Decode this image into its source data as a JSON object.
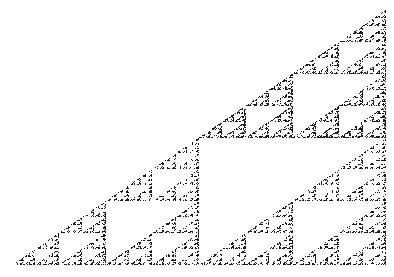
{
  "figure": {
    "subject": "Sierpinski triangle (right-angled variant)",
    "background": "#ffffff",
    "ink": "#1a1a1a",
    "vertices": {
      "bottom_left": [
        12,
        265
      ],
      "bottom_right": [
        386,
        265
      ],
      "apex": [
        386,
        10
      ]
    },
    "recursion_depth": 6,
    "texture": "speckled halftone"
  }
}
